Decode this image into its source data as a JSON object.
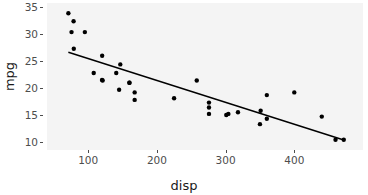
{
  "chart_data": {
    "type": "scatter",
    "title": "",
    "xlabel": "disp",
    "ylabel": "mpg",
    "xlim": [
      40,
      500
    ],
    "ylim": [
      8.5,
      35.8
    ],
    "xticks": [
      100,
      200,
      300,
      400
    ],
    "yticks": [
      10,
      15,
      20,
      25,
      30,
      35
    ],
    "grid": false,
    "legend": "none",
    "point_color": "#000000",
    "line_color": "#000000",
    "panel_color": "#f4f4f4",
    "series": [
      {
        "name": "mtcars",
        "x": [
          160,
          160,
          108,
          258,
          360,
          225,
          360,
          146.7,
          140.8,
          167.6,
          167.6,
          275.8,
          275.8,
          275.8,
          472,
          460,
          440,
          78.7,
          75.7,
          71.1,
          120.1,
          318,
          304,
          350,
          400,
          79,
          120.3,
          95.1,
          351,
          145,
          301,
          121
        ],
        "y": [
          21.0,
          21.0,
          22.8,
          21.4,
          18.7,
          18.1,
          14.3,
          24.4,
          22.8,
          19.2,
          17.8,
          16.4,
          17.3,
          15.2,
          10.4,
          10.4,
          14.7,
          32.4,
          30.4,
          33.9,
          21.5,
          15.5,
          15.2,
          13.3,
          19.2,
          27.3,
          26.0,
          30.4,
          15.8,
          19.7,
          15.0,
          21.4
        ]
      }
    ],
    "fit_line": {
      "name": "linear regression",
      "x0": 71.1,
      "y0": 26.65,
      "x1": 472,
      "y1": 10.35
    }
  },
  "axes": {
    "x": {
      "title": "disp",
      "tick_labels": [
        "100",
        "200",
        "300",
        "400"
      ]
    },
    "y": {
      "title": "mpg",
      "tick_labels": [
        "10",
        "15",
        "20",
        "25",
        "30",
        "35"
      ]
    }
  }
}
